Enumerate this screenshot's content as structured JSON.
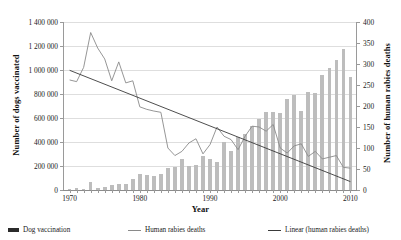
{
  "chart_data": {
    "type": "bar",
    "title": "",
    "xlabel": "Year",
    "ylabel": "Number of dogs vaccinated",
    "ylabel_secondary": "Number of human rabies deaths",
    "grid": true,
    "legend_position": "bottom",
    "xlim": [
      1969.2,
      2010.8
    ],
    "ylim": [
      0,
      1400000
    ],
    "ylim_secondary": [
      0,
      400
    ],
    "xticks": [
      1970,
      1980,
      1990,
      2000,
      2010
    ],
    "xtick_labels": [
      "1970",
      "1980",
      "1990",
      "2000",
      "2010"
    ],
    "yticks": [
      0,
      200000,
      400000,
      600000,
      800000,
      1000000,
      1200000,
      1400000
    ],
    "ytick_labels": [
      "0",
      "200 000",
      "400 000",
      "600 000",
      "800 000",
      "1 000 000",
      "1 200 000",
      "1 400 000"
    ],
    "yticks_secondary": [
      0,
      50,
      100,
      150,
      200,
      250,
      300,
      350,
      400
    ],
    "ytick_labels_secondary": [
      "0",
      "50",
      "100",
      "150",
      "200",
      "250",
      "300",
      "350",
      "400"
    ],
    "x": [
      1970,
      1971,
      1972,
      1973,
      1974,
      1975,
      1976,
      1977,
      1978,
      1979,
      1980,
      1981,
      1982,
      1983,
      1984,
      1985,
      1986,
      1987,
      1988,
      1989,
      1990,
      1991,
      1992,
      1993,
      1994,
      1995,
      1996,
      1997,
      1998,
      1999,
      2000,
      2001,
      2002,
      2003,
      2004,
      2005,
      2006,
      2007,
      2008,
      2009,
      2010
    ],
    "series": [
      {
        "name": "Dog vaccination",
        "type": "bar",
        "axis": "left",
        "color": "#bdbdbd",
        "values": [
          5000,
          18000,
          12000,
          65000,
          14000,
          22000,
          38000,
          52000,
          48000,
          95000,
          130000,
          128000,
          118000,
          130000,
          185000,
          195000,
          255000,
          200000,
          212000,
          285000,
          255000,
          232000,
          400000,
          322000,
          440000,
          465000,
          535000,
          590000,
          650000,
          650000,
          645000,
          760000,
          790000,
          660000,
          820000,
          812000,
          955000,
          1015000,
          1085000,
          1175000,
          940000
        ]
      },
      {
        "name": "Human rabies deaths",
        "type": "line",
        "axis": "right",
        "color": "#8a8a8a",
        "values": [
          262,
          258,
          292,
          375,
          338,
          312,
          260,
          305,
          255,
          260,
          198,
          192,
          188,
          185,
          100,
          82,
          92,
          112,
          122,
          86,
          108,
          150,
          128,
          120,
          96,
          128,
          152,
          150,
          140,
          156,
          100,
          88,
          105,
          110,
          80,
          92,
          74,
          78,
          82,
          54,
          52
        ]
      },
      {
        "name": "Linear (human rabies deaths)",
        "type": "trendline",
        "axis": "right",
        "color": "#3a3a3a",
        "start": {
          "x": 1970,
          "y": 285
        },
        "end": {
          "x": 2010,
          "y": 20
        }
      }
    ]
  },
  "legend": {
    "items": [
      {
        "label": "Dog vaccination",
        "marker": "bar-swatch",
        "color": "#2b2b2b"
      },
      {
        "label": "Human rabies deaths",
        "marker": "line-swatch",
        "color": "#8a8a8a"
      },
      {
        "label": "Linear (human rabies deaths)",
        "marker": "line-swatch",
        "color": "#3a3a3a"
      }
    ]
  }
}
